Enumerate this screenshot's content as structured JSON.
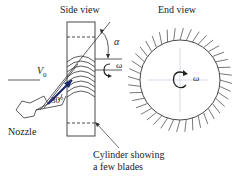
{
  "figure": {
    "side_view_label": "Side view",
    "end_view_label": "End view",
    "nozzle_label": "Nozzle",
    "cylinder_label_line1": "Cylinder showing",
    "cylinder_label_line2": "a few blades",
    "velocity_symbol": "V",
    "velocity_subscript": "0",
    "angle_alpha": "α",
    "angle_jet": "30°",
    "omega_side": "ω",
    "omega_end": "ω",
    "colors": {
      "line": "#333333",
      "jet": "#1a2a6c",
      "axis": "#b8c4d8"
    }
  }
}
